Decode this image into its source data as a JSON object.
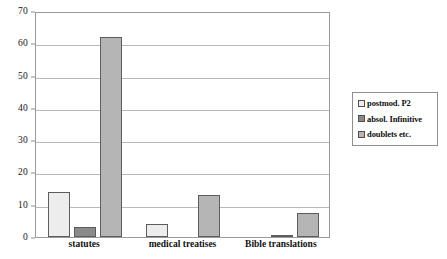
{
  "chart_data": {
    "type": "bar",
    "title": "",
    "subtitle": "",
    "xlabel": "",
    "ylabel": "",
    "categories": [
      "statutes",
      "medical treatises",
      "Bible translations"
    ],
    "series": [
      {
        "name": "postmod. P2",
        "color": "#ededed",
        "values": [
          13.8,
          4.0,
          0
        ]
      },
      {
        "name": "absol. Infinitive",
        "color": "#8a8a8a",
        "values": [
          3.1,
          0,
          0.7
        ]
      },
      {
        "name": "doublets etc.",
        "color": "#b5b5b5",
        "values": [
          61.8,
          13.0,
          7.4
        ]
      }
    ],
    "ylim": [
      0,
      70
    ],
    "yticks": [
      0,
      10,
      20,
      30,
      40,
      50,
      60,
      70
    ],
    "ytick_labels": [
      "0",
      "10",
      "20",
      "30",
      "40",
      "50",
      "60",
      "70"
    ],
    "grid": true,
    "grid_axis": "y",
    "legend_position": "right",
    "legend_entries": [
      "postmod. P2",
      "absol. Infinitive",
      "doublets etc."
    ],
    "annotations": []
  }
}
